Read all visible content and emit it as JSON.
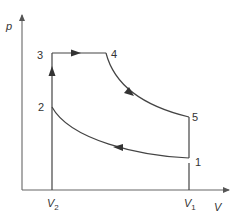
{
  "diagram": {
    "type": "pV cycle diagram",
    "axes": {
      "y_label": "p",
      "x_label": "V"
    },
    "volume_marks": [
      {
        "main": "V",
        "sub": "2"
      },
      {
        "main": "V",
        "sub": "1"
      }
    ],
    "points": [
      {
        "label": "1"
      },
      {
        "label": "2"
      },
      {
        "label": "3"
      },
      {
        "label": "4"
      },
      {
        "label": "5"
      }
    ],
    "processes": [
      {
        "from": "1",
        "to": "2",
        "kind": "compression curve",
        "arrow": "leftward"
      },
      {
        "from": "2",
        "to": "3",
        "kind": "constant volume",
        "arrow": "upward"
      },
      {
        "from": "3",
        "to": "4",
        "kind": "constant pressure",
        "arrow": "rightward"
      },
      {
        "from": "4",
        "to": "5",
        "kind": "expansion curve",
        "arrow": "downward-right"
      },
      {
        "from": "5",
        "to": "1",
        "kind": "constant volume",
        "arrow": "none"
      }
    ],
    "colors": {
      "line": "#444444",
      "axis": "#666666",
      "text": "#333333"
    }
  }
}
